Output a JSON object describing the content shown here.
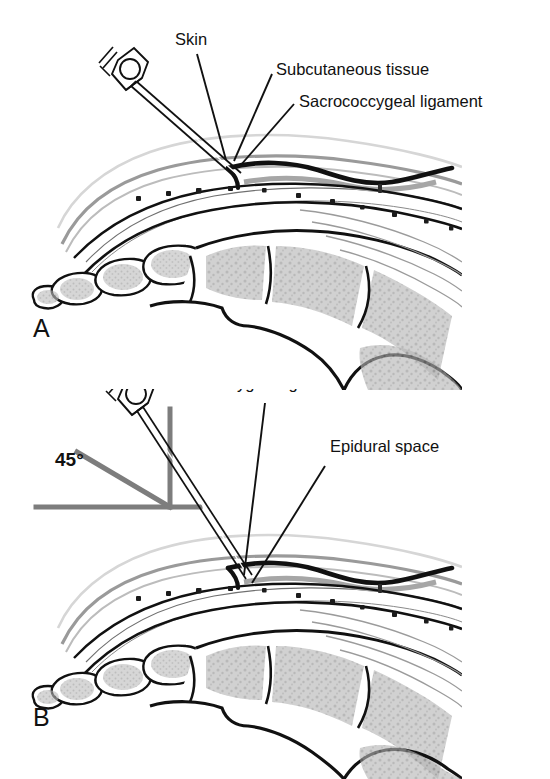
{
  "figure": {
    "type": "medical-illustration",
    "panel_count": 2,
    "colors": {
      "ink": "#111111",
      "bone_fill": "#a8a8a8",
      "soft_tissue": "#8f8f8f",
      "skin_line": "#d2d2d2",
      "angle_marker": "#7d7d7d",
      "background": "#ffffff"
    }
  },
  "panel_a": {
    "letter": "A",
    "labels": [
      {
        "text": "Skin",
        "x": 175,
        "y": 38
      },
      {
        "text": "Subcutaneous tissue",
        "x": 276,
        "y": 68
      },
      {
        "text": "Sacrococcygeal ligament",
        "x": 299,
        "y": 100
      }
    ],
    "needle": {
      "name": "needle-with-hub",
      "angle_deg": 55,
      "depth": "tip at sacrococcygeal ligament"
    }
  },
  "panel_b": {
    "letter": "B",
    "labels": [
      {
        "text": "Sacrococcygeal ligament",
        "x": 160,
        "y": 375
      },
      {
        "text": "Epidural space",
        "x": 330,
        "y": 438
      },
      {
        "text": "45°",
        "x": 55,
        "y": 459
      }
    ],
    "angle_value": "45°",
    "needle": {
      "name": "needle-with-hub",
      "angle_deg": 45,
      "depth": "tip advanced into epidural space"
    },
    "angle_markers": [
      "vertical-reference-line",
      "horizontal-reference-line",
      "forty-five-degree-line"
    ]
  }
}
